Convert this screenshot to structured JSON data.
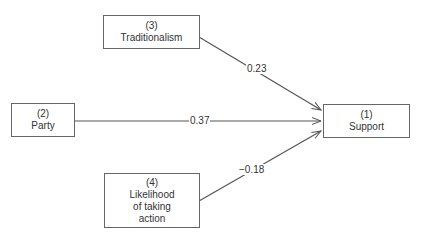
{
  "diagram": {
    "type": "path-diagram",
    "nodes": [
      {
        "id": "1",
        "number": "(1)",
        "label": "Support"
      },
      {
        "id": "2",
        "number": "(2)",
        "label": "Party"
      },
      {
        "id": "3",
        "number": "(3)",
        "label": "Traditionalism"
      },
      {
        "id": "4",
        "number": "(4)",
        "label": "Likelihood\nof  taking\naction"
      }
    ],
    "edges": [
      {
        "from": "3",
        "to": "1",
        "coefficient": "0.23"
      },
      {
        "from": "2",
        "to": "1",
        "coefficient": "0.37"
      },
      {
        "from": "4",
        "to": "1",
        "coefficient": "−0.18"
      }
    ]
  }
}
